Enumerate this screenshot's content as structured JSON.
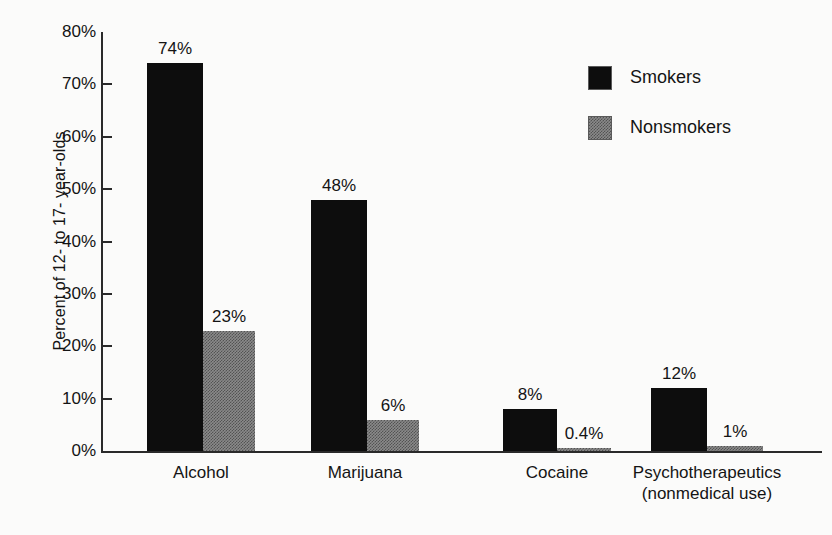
{
  "chart_data": {
    "type": "bar",
    "title": "",
    "xlabel": "",
    "ylabel": "Percent of 12- to 17- year-olds",
    "ylim": [
      0,
      80
    ],
    "grid": false,
    "legend_position": "top-right",
    "categories": [
      "Alcohol",
      "Marijuana",
      "Cocaine",
      "Psychotherapeutics"
    ],
    "category_sublabels": [
      "",
      "",
      "",
      "(nonmedical use)"
    ],
    "ytick_labels": [
      "0%",
      "10%",
      "20%",
      "30%",
      "40%",
      "50%",
      "60%",
      "70%",
      "80%"
    ],
    "ytick_values": [
      0,
      10,
      20,
      30,
      40,
      50,
      60,
      70,
      80
    ],
    "series": [
      {
        "name": "Smokers",
        "color": "#0d0d0d",
        "values": [
          74,
          48,
          8,
          12
        ],
        "value_labels": [
          "74%",
          "48%",
          "8%",
          "12%"
        ]
      },
      {
        "name": "Nonsmokers",
        "color": "#8a8a8a",
        "values": [
          23,
          6,
          0.4,
          1
        ],
        "value_labels": [
          "23%",
          "6%",
          "0.4%",
          "1%"
        ]
      }
    ]
  }
}
